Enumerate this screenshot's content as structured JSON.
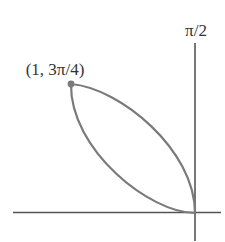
{
  "figure": {
    "type": "polar-petal",
    "axis_label_top": "π/2",
    "point_label": "(1, 3π/4)",
    "colors": {
      "background": "#ffffff",
      "axis": "#555555",
      "curve": "#7a7a7a",
      "point": "#7a7a7a",
      "text": "#333333"
    },
    "geometry": {
      "origin": [
        195,
        213
      ],
      "horizontal_axis": [
        [
          13,
          212.5
        ],
        [
          221,
          212.5
        ]
      ],
      "vertical_axis": [
        [
          195,
          43
        ],
        [
          195,
          241
        ]
      ],
      "point": [
        71,
        84
      ],
      "upper_arc": "M71,84 C120,88 195,150 195,213",
      "lower_arc": "M71,84 C70,150 150,213 195,213"
    }
  }
}
